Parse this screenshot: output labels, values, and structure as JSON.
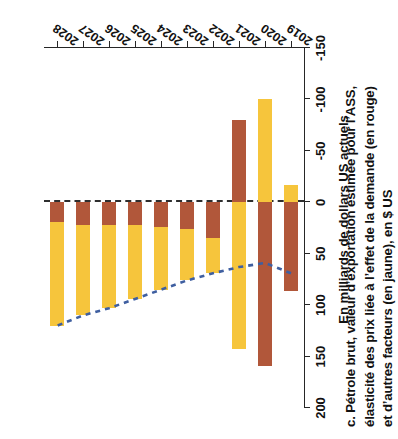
{
  "figure": {
    "title_lines": [
      "c. Pétrole brut, valeur d’exportation estimée pour l’ASS,",
      "élasticité des prix liée à l’effet de la demande (en rouge)",
      "et d’autres facteurs (en jaune), en $ US"
    ],
    "y_axis_label": "En milliards de dollars US actuels",
    "orientation": "rotated-90"
  },
  "colors": {
    "demand_elasticity_red": "#b1573a",
    "other_factors_yellow": "#f6c53c",
    "trend_line_blue": "#3f5fa0",
    "zero_line": "#2e2e2e",
    "axis": "#262626"
  },
  "chart_data": {
    "type": "bar",
    "title": "c. Pétrole brut, valeur d’exportation estimée pour l’ASS, élasticité des prix liée à l’effet de la demande (en rouge) et d’autres facteurs (en jaune), en $ US",
    "xlabel": "",
    "ylabel": "En milliards de dollars US actuels",
    "orientation": "horizontal-stacked",
    "categories": [
      "2019",
      "2020",
      "2021",
      "2022",
      "2023",
      "2024",
      "2025",
      "2026",
      "2027",
      "2028"
    ],
    "value_axis_ticks": [
      200,
      150,
      100,
      50,
      0,
      -50,
      -100,
      -150
    ],
    "value_axis_tick_labels": [
      "200",
      "150",
      "100",
      "50",
      "0",
      "-50",
      "-100",
      "-150"
    ],
    "ylim": [
      -150,
      200
    ],
    "grid": false,
    "legend_position": "in-title",
    "series": [
      {
        "name": "Effet de la demande (en rouge)",
        "color": "#b1573a",
        "values": [
          86,
          159,
          -80,
          35,
          26,
          24,
          22,
          22,
          22,
          19
        ]
      },
      {
        "name": "Autres facteurs (en jaune)",
        "color": "#f6c53c",
        "values": [
          -17,
          -100,
          143,
          34,
          50,
          61,
          72,
          81,
          88,
          101
        ]
      }
    ],
    "totals": [
      69,
      59,
      63,
      69,
      76,
      85,
      94,
      103,
      110,
      120
    ],
    "annotations": [
      {
        "type": "trend-line",
        "style": "dashed",
        "color": "#3f5fa0",
        "label": "",
        "points": [
          {
            "category": "2019",
            "value": 69
          },
          {
            "category": "2020",
            "value": 59
          },
          {
            "category": "2021",
            "value": 63
          },
          {
            "category": "2022",
            "value": 69
          },
          {
            "category": "2023",
            "value": 76
          },
          {
            "category": "2024",
            "value": 85
          },
          {
            "category": "2025",
            "value": 94
          },
          {
            "category": "2026",
            "value": 103
          },
          {
            "category": "2027",
            "value": 110
          },
          {
            "category": "2028",
            "value": 120
          }
        ]
      }
    ]
  }
}
